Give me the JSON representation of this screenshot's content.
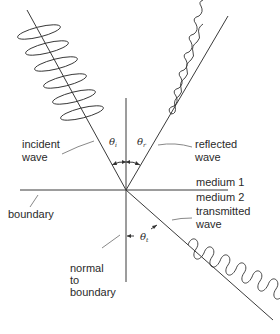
{
  "diagram": {
    "labels": {
      "incident": [
        "incident",
        "wave"
      ],
      "reflected": [
        "reflected",
        "wave"
      ],
      "transmitted": [
        "transmitted",
        "wave"
      ],
      "boundary": "boundary",
      "normal": [
        "normal",
        "to",
        "boundary"
      ],
      "medium1": "medium 1",
      "medium2": "medium 2"
    },
    "angles": {
      "incident": {
        "symbol": "θ",
        "subscript": "i"
      },
      "reflected": {
        "symbol": "θ",
        "subscript": "r"
      },
      "transmitted": {
        "symbol": "θ",
        "subscript": "t"
      }
    },
    "colors": {
      "line": "#3a3a3a",
      "text": "#2a2a2a",
      "background": "#ffffff"
    }
  }
}
